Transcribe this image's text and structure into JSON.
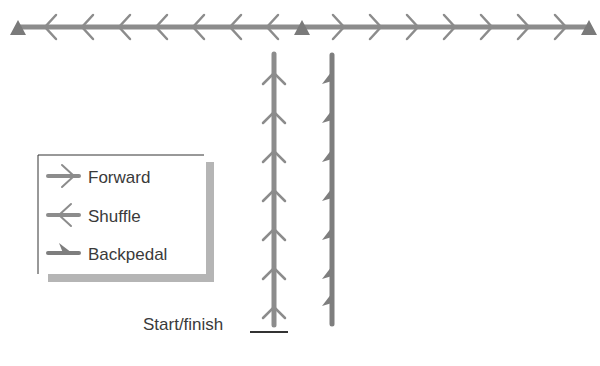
{
  "diagram": {
    "title": "",
    "colors": {
      "line": "#8c8c8c",
      "line_dark": "#7e7e7e",
      "cone": "#7a7a7a",
      "text": "#3a3a3a",
      "legend_border": "#333333",
      "legend_shadow": "#b5b5b5"
    },
    "cones": [
      {
        "name": "left-cone",
        "x": 18
      },
      {
        "name": "center-cone",
        "x": 302
      },
      {
        "name": "right-cone",
        "x": 589
      }
    ],
    "top_line": {
      "left_segment": {
        "movement": "Shuffle",
        "direction": "left",
        "chevrons": 7
      },
      "right_segment": {
        "movement": "Forward",
        "direction": "right",
        "chevrons": 7
      }
    },
    "vertical_lines": [
      {
        "name": "forward-path",
        "movement": "Forward",
        "direction": "up",
        "markers": 7
      },
      {
        "name": "backpedal-path",
        "movement": "Backpedal",
        "direction": "down",
        "markers": 7
      }
    ],
    "legend": {
      "items": [
        {
          "icon": "forward-arrow-icon",
          "label": "Forward"
        },
        {
          "icon": "shuffle-arrow-icon",
          "label": "Shuffle"
        },
        {
          "icon": "backpedal-arrow-icon",
          "label": "Backpedal"
        }
      ]
    },
    "start_finish_label": "Start/finish"
  }
}
